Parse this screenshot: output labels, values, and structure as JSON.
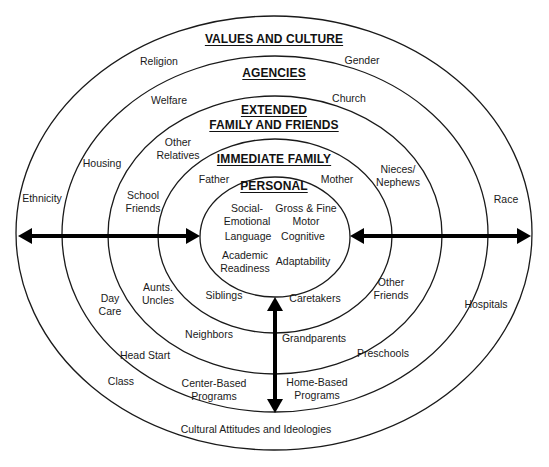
{
  "diagram": {
    "type": "concentric-ecological-model",
    "rings": [
      {
        "id": "values-culture",
        "title_lines": [
          "VALUES AND CULTURE"
        ],
        "items": [
          "Religion",
          "Gender",
          "Ethnicity",
          "Race",
          "Class",
          "Cultural Attitudes and Ideologies"
        ]
      },
      {
        "id": "agencies",
        "title_lines": [
          "AGENCIES"
        ],
        "items": [
          "Welfare",
          "Church",
          "Housing",
          "Day Care",
          "Hospitals",
          "Head Start",
          "Preschools",
          "Center-Based Programs",
          "Home-Based Programs"
        ]
      },
      {
        "id": "extended-family",
        "title_lines": [
          "EXTENDED",
          "FAMILY AND FRIENDS"
        ],
        "items": [
          "Other Relatives",
          "School Friends",
          "Nieces/ Nephews",
          "Aunts. Uncles",
          "Other Friends",
          "Neighbors",
          "Grandparents"
        ]
      },
      {
        "id": "immediate-family",
        "title_lines": [
          "IMMEDIATE FAMILY"
        ],
        "items": [
          "Father",
          "Mother",
          "Siblings",
          "Caretakers"
        ]
      },
      {
        "id": "personal",
        "title_lines": [
          "PERSONAL"
        ],
        "items": [
          "Social- Emotional",
          "Gross & Fine Motor",
          "Language",
          "Cognitive",
          "Academic Readiness",
          "Adaptability"
        ]
      }
    ],
    "labels": {
      "values_title": "VALUES AND CULTURE",
      "agencies_title": "AGENCIES",
      "extended_title_1": "EXTENDED",
      "extended_title_2": "FAMILY AND FRIENDS",
      "immediate_title": "IMMEDIATE FAMILY",
      "personal_title": "PERSONAL",
      "religion": "Religion",
      "gender": "Gender",
      "ethnicity": "Ethnicity",
      "race": "Race",
      "class": "Class",
      "cultural": "Cultural Attitudes and Ideologies",
      "welfare": "Welfare",
      "church": "Church",
      "housing": "Housing",
      "day_care_1": "Day",
      "day_care_2": "Care",
      "hospitals": "Hospitals",
      "head_start": "Head Start",
      "preschools": "Preschools",
      "center_based_1": "Center-Based",
      "center_based_2": "Programs",
      "home_based_1": "Home-Based",
      "home_based_2": "Programs",
      "other_relatives_1": "Other",
      "other_relatives_2": "Relatives",
      "school_friends_1": "School",
      "school_friends_2": "Friends",
      "nieces_1": "Nieces/",
      "nieces_2": "Nephews",
      "aunts_1": "Aunts.",
      "aunts_2": "Uncles",
      "other_friends_1": "Other",
      "other_friends_2": "Friends",
      "neighbors": "Neighbors",
      "grandparents": "Grandparents",
      "father": "Father",
      "mother": "Mother",
      "siblings": "Siblings",
      "caretakers": "Caretakers",
      "social_1": "Social-",
      "social_2": "Emotional",
      "motor_1": "Gross & Fine",
      "motor_2": "Motor",
      "language": "Language",
      "cognitive": "Cognitive",
      "academic_1": "Academic",
      "academic_2": "Readiness",
      "adaptability": "Adaptability"
    },
    "arrows": [
      {
        "name": "left-arrow",
        "direction": "bidirectional-horizontal"
      },
      {
        "name": "right-arrow",
        "direction": "bidirectional-horizontal"
      },
      {
        "name": "bottom-arrow",
        "direction": "bidirectional-vertical"
      }
    ],
    "colors": {
      "stroke": "#1a1a1a",
      "background": "#ffffff",
      "arrow": "#000000"
    }
  }
}
